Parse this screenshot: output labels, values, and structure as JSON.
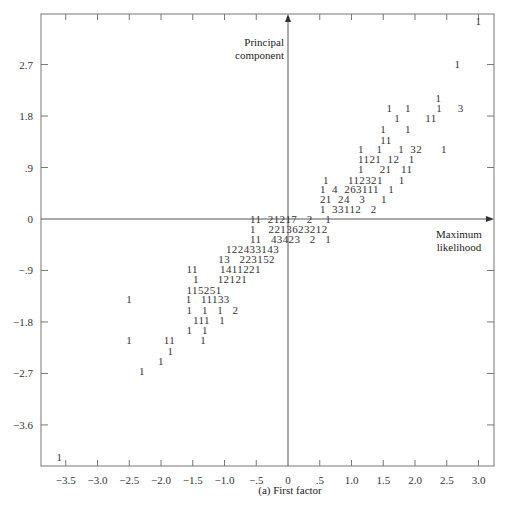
{
  "chart_data": {
    "type": "scatter",
    "subtype": "character-count scatter (digits show number of observations per cell)",
    "caption": "(a) First factor",
    "xlabel": "Maximum likelihood",
    "ylabel": "Principal component",
    "xlim": [
      -3.75,
      3.25
    ],
    "ylim": [
      -4.3,
      3.7
    ],
    "xticks": [
      -3.5,
      -3.0,
      -2.5,
      -2.0,
      -1.5,
      -1.0,
      -0.5,
      0,
      0.5,
      1.0,
      1.5,
      2.0,
      2.5,
      3.0
    ],
    "xtick_labels": [
      "−3.5",
      "−3.0",
      "−2.5",
      "−2.0",
      "−1.5",
      "−1.0",
      "−.5",
      "0",
      ".5",
      "1.0",
      "1.5",
      "2.0",
      "2.5",
      "3.0"
    ],
    "yticks": [
      2.7,
      1.8,
      0.9,
      0,
      -0.9,
      -1.8,
      -2.7,
      -3.6
    ],
    "ytick_labels": [
      "2.7",
      "1.8",
      ".9",
      "0",
      "−.9",
      "−1.8",
      "−2.7",
      "−3.6"
    ],
    "grid": false,
    "rows": [
      {
        "y": 3.45,
        "x": 3.0,
        "text": "1"
      },
      {
        "y": 2.7,
        "x": 2.67,
        "text": "1"
      },
      {
        "y": 2.1,
        "x": 2.37,
        "text": "1"
      },
      {
        "y": 1.93,
        "x": 1.6,
        "text": "1    1        1     3"
      },
      {
        "y": 1.75,
        "x": 1.72,
        "text": "1        11"
      },
      {
        "y": 1.55,
        "x": 1.5,
        "text": "1      1"
      },
      {
        "y": 1.37,
        "x": 1.5,
        "text": "11"
      },
      {
        "y": 1.2,
        "x": 1.15,
        "text": "1    1     1  32      1"
      },
      {
        "y": 1.03,
        "x": 1.15,
        "text": "1121  12   1"
      },
      {
        "y": 0.85,
        "x": 1.15,
        "text": "1     21   11"
      },
      {
        "y": 0.67,
        "x": 0.6,
        "text": "1      112321     1"
      },
      {
        "y": 0.5,
        "x": 0.55,
        "text": "1  4  263111   1"
      },
      {
        "y": 0.33,
        "x": 0.55,
        "text": "21  24   3     1"
      },
      {
        "y": 0.15,
        "x": 0.55,
        "text": "1  33112   2"
      },
      {
        "y": -0.02,
        "x": -0.55,
        "text": "11  21217   2    1"
      },
      {
        "y": -0.19,
        "x": -0.55,
        "text": "1    2213623212"
      },
      {
        "y": -0.37,
        "x": -0.55,
        "text": "11   43423   2   1"
      },
      {
        "y": -0.55,
        "x": -0.93,
        "text": "122433143"
      },
      {
        "y": -0.72,
        "x": -1.05,
        "text": "13   223152"
      },
      {
        "y": -0.9,
        "x": -1.55,
        "text": "11       1411221"
      },
      {
        "y": -1.07,
        "x": -1.45,
        "text": "1      12121"
      },
      {
        "y": -1.25,
        "x": -1.55,
        "text": "115251"
      },
      {
        "y": -1.42,
        "x": -2.5,
        "text": "1                 1   11133"
      },
      {
        "y": -1.6,
        "x": -1.55,
        "text": "1   1   1   2"
      },
      {
        "y": -1.78,
        "x": -1.45,
        "text": "111   1"
      },
      {
        "y": -1.96,
        "x": -1.55,
        "text": "1   1"
      },
      {
        "y": -2.14,
        "x": -2.5,
        "text": "1          11        1"
      },
      {
        "y": -2.32,
        "x": -1.85,
        "text": "1"
      },
      {
        "y": -2.5,
        "x": -2.0,
        "text": "1"
      },
      {
        "y": -2.68,
        "x": -2.3,
        "text": "1"
      },
      {
        "y": -4.18,
        "x": -3.6,
        "text": "1"
      }
    ]
  }
}
